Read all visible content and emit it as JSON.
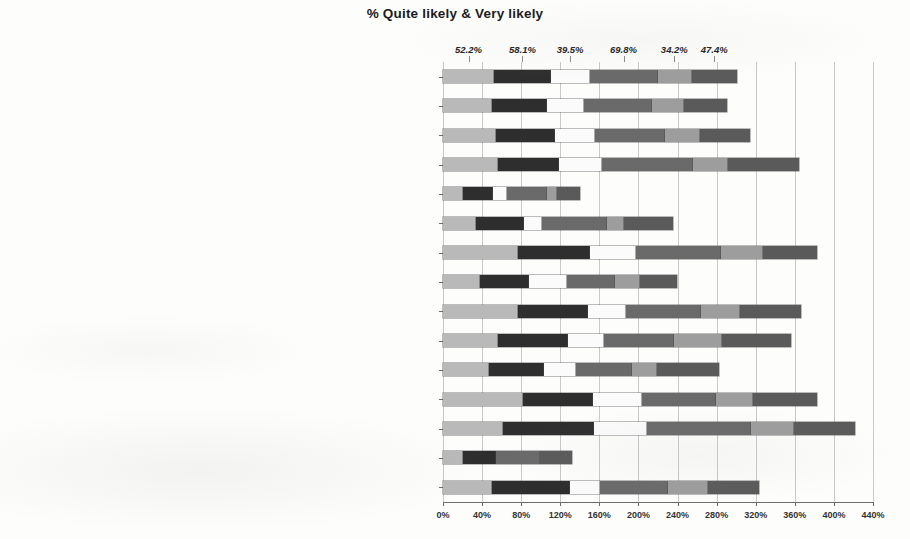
{
  "chart_data": {
    "type": "bar",
    "subtype": "horizontal-stacked",
    "title": "% Quite likely & Very likely",
    "xlabel": "",
    "ylabel": "",
    "xlim": [
      0,
      440
    ],
    "xtick_step": 40,
    "xticks": [
      "0%",
      "40%",
      "80%",
      "120%",
      "160%",
      "200%",
      "240%",
      "280%",
      "320%",
      "360%",
      "400%",
      "440%"
    ],
    "grid": true,
    "legend": "none",
    "series": [
      {
        "name": "Segment 1",
        "color": "#b9b9b9",
        "callout": "52.2%"
      },
      {
        "name": "Segment 2",
        "color": "#2e2e2e",
        "callout": "58.1%"
      },
      {
        "name": "Segment 3",
        "color": "#fbfbfb",
        "callout": "39.5%"
      },
      {
        "name": "Segment 4",
        "color": "#6a6a6a",
        "callout": "69.8%"
      },
      {
        "name": "Segment 5",
        "color": "#9d9d9d",
        "callout": "34.2%"
      },
      {
        "name": "Segment 6",
        "color": "#5a5a5a",
        "callout": "47.4%"
      }
    ],
    "callout_labels": [
      "52.2%",
      "58.1%",
      "39.5%",
      "69.8%",
      "34.2%",
      "47.4%"
    ],
    "categories": [
      "All respondents (494)",
      "English (248)",
      "Non-English (246)",
      "Entrepreneurs/latent entrepreneurs/social entrepreneurs/self-employed (90)",
      "Elderly/retirees/pre-retirees (71)",
      "Migrants/Members of an ethnic minority (6)",
      "Children/Parents of young children (30)",
      "Customers: Indebted/Overindebted households (8)",
      "Customers: Investors/Potential investors/Depositors (31)",
      "Unemployed/trainees (25)",
      "Active citizens/taxpayers (158)",
      "Mortgage owners/home owners/first-time buyers (38)",
      "Professionals in financial services/financial experts (28)",
      "Government executives and political-party members/local authorities (3)",
      "Collective investors/borrowers/third sector organisations (5)"
    ],
    "rows": [
      {
        "category": "All respondents (494)",
        "values": [
          52.2,
          58.1,
          39.5,
          69.8,
          34.2,
          47.4
        ],
        "total": 301.2
      },
      {
        "category": "English (248)",
        "values": [
          50.0,
          56.0,
          38.0,
          69.0,
          33.0,
          45.0
        ],
        "total": 291.0
      },
      {
        "category": "Non-English (246)",
        "values": [
          54.0,
          60.0,
          41.0,
          72.0,
          35.0,
          52.0
        ],
        "total": 314.0
      },
      {
        "category": "Entrepreneurs/latent entrepreneurs/social entrepreneurs/self-employed (90)",
        "values": [
          56.0,
          62.0,
          44.0,
          93.0,
          36.0,
          73.0
        ],
        "total": 364.0
      },
      {
        "category": "Elderly/retirees/pre-retirees (71)",
        "values": [
          20.0,
          31.0,
          14.0,
          41.0,
          10.0,
          24.0
        ],
        "total": 140.0
      },
      {
        "category": "Migrants/Members of an ethnic minority (6)",
        "values": [
          33.0,
          50.0,
          17.0,
          67.0,
          17.0,
          51.0
        ],
        "total": 235.0
      },
      {
        "category": "Children/Parents of young children (30)",
        "values": [
          77.0,
          73.0,
          47.0,
          87.0,
          43.0,
          56.0
        ],
        "total": 383.0
      },
      {
        "category": "Customers: Indebted/Overindebted households (8)",
        "values": [
          38.0,
          50.0,
          38.0,
          50.0,
          25.0,
          38.0
        ],
        "total": 239.0
      },
      {
        "category": "Customers: Investors/Potential investors/Depositors (31)",
        "values": [
          77.0,
          71.0,
          39.0,
          77.0,
          39.0,
          63.0
        ],
        "total": 366.0
      },
      {
        "category": "Unemployed/trainees (25)",
        "values": [
          56.0,
          72.0,
          36.0,
          72.0,
          48.0,
          72.0
        ],
        "total": 356.0
      },
      {
        "category": "Active citizens/taxpayers (158)",
        "values": [
          47.0,
          56.0,
          32.0,
          58.0,
          25.0,
          64.0
        ],
        "total": 282.0
      },
      {
        "category": "Mortgage owners/home owners/first-time buyers (38)",
        "values": [
          82.0,
          71.0,
          50.0,
          76.0,
          37.0,
          67.0
        ],
        "total": 383.0
      },
      {
        "category": "Professionals in financial services/financial experts (28)",
        "values": [
          61.0,
          93.0,
          54.0,
          107.0,
          43.0,
          64.0
        ],
        "total": 422.0
      },
      {
        "category": "Government executives and political-party members/local authorities (3)",
        "values": [
          20.0,
          33.0,
          0.0,
          46.0,
          0.0,
          33.0
        ],
        "total": 132.0
      },
      {
        "category": "Collective investors/borrowers/third sector organisations (5)",
        "values": [
          50.0,
          80.0,
          30.0,
          70.0,
          40.0,
          53.0
        ],
        "total": 323.0
      }
    ]
  }
}
